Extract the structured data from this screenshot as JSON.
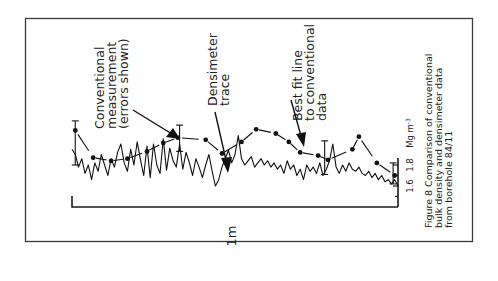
{
  "chart_data": {
    "type": "line",
    "title": "Figure 8  Comparison of conventional bulk density and densimeter data from borehole 84/11",
    "caption_lines": [
      "Figure 8  Comparison of conventional",
      "bulk density and densimeter data",
      "from borehole 84/11"
    ],
    "orientation": "rotated 90° (depth along horizontal, density on right vertical axis)",
    "xlabel": "1m",
    "x_scale_length_m": 1,
    "xlim": [
      0,
      1
    ],
    "ylabel": "Mg m-3",
    "ylabel_parts": {
      "base": "Mg m",
      "sup": "-3"
    },
    "yticks": [
      1.6,
      1.8
    ],
    "ytick_labels": [
      "1.6",
      "1.8"
    ],
    "ylim": [
      1.4,
      2.3
    ],
    "grid": false,
    "annotations": [
      {
        "id": "conventional",
        "lines": [
          "Conventional",
          "measurement",
          "(errors shown)"
        ]
      },
      {
        "id": "densimeter",
        "lines": [
          "Densimeter",
          "trace"
        ]
      },
      {
        "id": "bestfit",
        "lines": [
          "Best fit line",
          "to conventional",
          "data"
        ]
      }
    ],
    "series": [
      {
        "name": "Conventional measurement",
        "style": "points with error bars, dashed best-fit line",
        "x": [
          0.01,
          0.065,
          0.12,
          0.17,
          0.23,
          0.28,
          0.325,
          0.41,
          0.46,
          0.52,
          0.565,
          0.625,
          0.665,
          0.7,
          0.755,
          0.785,
          0.86,
          0.88,
          0.935,
          0.99
        ],
        "y": [
          2.13,
          1.87,
          1.84,
          1.86,
          1.93,
          2.01,
          2.06,
          2.04,
          1.91,
          2.02,
          2.14,
          2.1,
          2.02,
          1.92,
          1.89,
          1.85,
          1.95,
          2.07,
          1.82,
          1.7
        ],
        "error_bars": [
          {
            "x": 0.01,
            "low": 1.8,
            "high": 2.22
          },
          {
            "x": 0.33,
            "low": 1.93,
            "high": 2.18
          },
          {
            "x": 0.775,
            "low": 1.71,
            "high": 2.03
          },
          {
            "x": 0.985,
            "low": 1.62,
            "high": 1.82
          }
        ]
      },
      {
        "name": "Densimeter trace",
        "style": "continuous line",
        "x": [
          0.0,
          0.01,
          0.02,
          0.03,
          0.04,
          0.05,
          0.06,
          0.07,
          0.08,
          0.09,
          0.1,
          0.11,
          0.12,
          0.13,
          0.14,
          0.15,
          0.16,
          0.17,
          0.18,
          0.19,
          0.2,
          0.21,
          0.22,
          0.23,
          0.24,
          0.25,
          0.26,
          0.27,
          0.28,
          0.29,
          0.3,
          0.31,
          0.32,
          0.33,
          0.34,
          0.35,
          0.36,
          0.37,
          0.38,
          0.39,
          0.4,
          0.41,
          0.42,
          0.43,
          0.44,
          0.45,
          0.46,
          0.47,
          0.48,
          0.49,
          0.5,
          0.51,
          0.52,
          0.53,
          0.54,
          0.55,
          0.56,
          0.57,
          0.58,
          0.59,
          0.6,
          0.61,
          0.62,
          0.63,
          0.64,
          0.65,
          0.66,
          0.67,
          0.68,
          0.69,
          0.7,
          0.71,
          0.72,
          0.73,
          0.74,
          0.75,
          0.76,
          0.77,
          0.78,
          0.79,
          0.8,
          0.81,
          0.82,
          0.83,
          0.84,
          0.85,
          0.86,
          0.87,
          0.88,
          0.89,
          0.9,
          0.91,
          0.92,
          0.93,
          0.94,
          0.95,
          0.96,
          0.97,
          0.98,
          0.99,
          1.0
        ],
        "y": [
          1.95,
          1.9,
          1.78,
          1.86,
          1.72,
          1.8,
          1.66,
          1.82,
          1.74,
          1.9,
          1.8,
          1.7,
          1.86,
          1.78,
          1.92,
          2.0,
          1.82,
          1.74,
          1.95,
          1.8,
          2.02,
          1.85,
          1.7,
          1.98,
          1.68,
          2.0,
          1.8,
          1.72,
          2.05,
          1.75,
          1.96,
          1.84,
          1.78,
          2.0,
          1.76,
          1.92,
          1.82,
          1.7,
          1.86,
          1.78,
          1.68,
          1.8,
          1.9,
          1.74,
          1.6,
          1.66,
          1.78,
          1.86,
          1.94,
          1.82,
          1.9,
          2.08,
          1.86,
          1.8,
          1.84,
          1.88,
          1.78,
          1.82,
          1.86,
          1.8,
          1.84,
          1.78,
          1.82,
          1.76,
          1.8,
          1.72,
          1.84,
          1.76,
          1.8,
          1.7,
          1.76,
          1.66,
          1.8,
          1.74,
          1.78,
          1.72,
          1.82,
          1.7,
          1.76,
          1.84,
          2.0,
          1.78,
          1.72,
          1.8,
          1.74,
          1.82,
          1.76,
          1.74,
          1.78,
          1.72,
          1.7,
          1.74,
          1.68,
          1.72,
          1.66,
          1.7,
          1.64,
          1.66,
          1.62,
          1.66,
          1.6
        ]
      }
    ]
  }
}
